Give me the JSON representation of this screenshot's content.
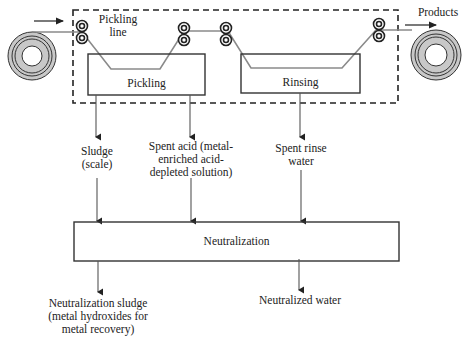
{
  "diagram": {
    "top": {
      "pickling_line_label": [
        "Pickling",
        "line"
      ],
      "pickling_tank_label": "Pickling",
      "rinsing_tank_label": "Rinsing",
      "products_label": "Products"
    },
    "outputs": {
      "sludge": [
        "Sludge",
        "(scale)"
      ],
      "spent_acid": [
        "Spent acid (metal-",
        "enriched acid-",
        "depleted solution)"
      ],
      "spent_rinse": [
        "Spent rinse",
        "water"
      ]
    },
    "neutralization_label": "Neutralization",
    "final_outputs": {
      "sludge": [
        "Neutralization sludge",
        "(metal hydroxides for",
        "metal recovery)"
      ],
      "water": "Neutralized water"
    },
    "colors": {
      "line": "#333333",
      "strip": "#8a8a8a",
      "coil_fill": "#c8c8c8"
    }
  }
}
